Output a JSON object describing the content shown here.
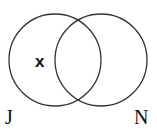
{
  "diagram": {
    "type": "venn",
    "sets": [
      {
        "label": "J",
        "cx": 55,
        "cy": 60,
        "r": 46
      },
      {
        "label": "N",
        "cx": 101,
        "cy": 60,
        "r": 46
      }
    ],
    "marker": {
      "text": "x",
      "region": "J only"
    },
    "stroke_color": "#333333"
  }
}
